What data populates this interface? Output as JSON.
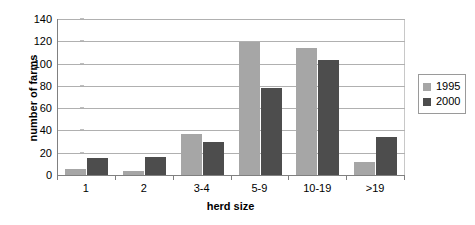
{
  "chart_data": {
    "type": "bar",
    "title": "",
    "xlabel": "herd size",
    "ylabel": "number of farms",
    "categories": [
      "1",
      "2",
      "3-4",
      "5-9",
      "10-19",
      ">19"
    ],
    "series": [
      {
        "name": "1995",
        "color": "#a6a6a6",
        "values": [
          5,
          4,
          37,
          119,
          114,
          12
        ]
      },
      {
        "name": "2000",
        "color": "#4d4d4d",
        "values": [
          15,
          16,
          30,
          78,
          103,
          34
        ]
      }
    ],
    "ylim": [
      0,
      140
    ],
    "ytick_step": 20,
    "yticks": [
      "0",
      "20",
      "40",
      "60",
      "80",
      "100",
      "120",
      "140"
    ],
    "grid": true,
    "legend_position": "right",
    "legend_entries": [
      "1995",
      "2000"
    ]
  }
}
